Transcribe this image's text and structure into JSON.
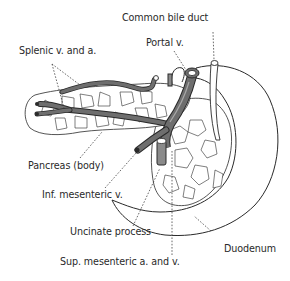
{
  "diagram": {
    "colors": {
      "outline": "#2a2a2a",
      "vessel_fill": "#6e6e6e",
      "vessel_highlight": "#a8a8a8",
      "leader_line": "#444444",
      "background": "#ffffff"
    },
    "labels": [
      {
        "id": "common-bile-duct",
        "text": "Common bile duct"
      },
      {
        "id": "portal-v",
        "text": "Portal v."
      },
      {
        "id": "splenic-v-and-a",
        "text": "Splenic v. and a."
      },
      {
        "id": "pancreas-body",
        "text": "Pancreas (body)"
      },
      {
        "id": "inf-mesenteric-v",
        "text": "Inf. mesenteric v."
      },
      {
        "id": "uncinate-process",
        "text": "Uncinate process"
      },
      {
        "id": "duodenum",
        "text": "Duodenum"
      },
      {
        "id": "sup-mesenteric-a-and-v",
        "text": "Sup. mesenteric a. and v."
      }
    ]
  }
}
